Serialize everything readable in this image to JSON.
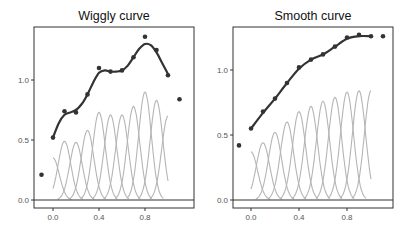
{
  "chart_data": [
    {
      "type": "line",
      "title": "Wiggly curve",
      "xlabel": "",
      "ylabel": "",
      "xlim": [
        -0.13,
        1.13
      ],
      "ylim": [
        -0.06,
        1.45
      ],
      "x_ticks": [
        "0.0",
        "0.4",
        "0.8"
      ],
      "y_ticks": [
        "0.0",
        "0.5",
        "1.0"
      ],
      "grid": false,
      "points": {
        "x": [
          -0.1,
          0.0,
          0.1,
          0.2,
          0.3,
          0.4,
          0.5,
          0.6,
          0.7,
          0.8,
          0.9,
          1.0,
          1.1
        ],
        "y": [
          0.21,
          0.52,
          0.74,
          0.73,
          0.88,
          1.1,
          1.07,
          1.08,
          1.19,
          1.36,
          1.25,
          1.04,
          0.84
        ]
      },
      "fitted_curve": {
        "x": [
          0.0,
          0.05,
          0.1,
          0.15,
          0.2,
          0.25,
          0.3,
          0.35,
          0.4,
          0.45,
          0.5,
          0.55,
          0.6,
          0.65,
          0.7,
          0.75,
          0.8,
          0.85,
          0.9,
          0.95,
          1.0
        ],
        "y": [
          0.52,
          0.64,
          0.71,
          0.73,
          0.75,
          0.8,
          0.88,
          0.98,
          1.06,
          1.08,
          1.07,
          1.07,
          1.08,
          1.12,
          1.19,
          1.26,
          1.3,
          1.29,
          1.23,
          1.14,
          1.05
        ]
      },
      "basis_peaks": {
        "x": [
          0.0,
          0.1,
          0.2,
          0.3,
          0.4,
          0.5,
          0.6,
          0.7,
          0.8,
          0.9,
          1.0
        ],
        "height": [
          0.35,
          0.49,
          0.48,
          0.58,
          0.73,
          0.71,
          0.71,
          0.78,
          0.9,
          0.83,
          0.7
        ]
      }
    },
    {
      "type": "line",
      "title": "Smooth curve",
      "xlabel": "",
      "ylabel": "",
      "xlim": [
        -0.13,
        1.13
      ],
      "ylim": [
        -0.06,
        1.35
      ],
      "x_ticks": [
        "0.0",
        "0.4",
        "0.8"
      ],
      "y_ticks": [
        "0.0",
        "0.5",
        "1.0"
      ],
      "grid": false,
      "points": {
        "x": [
          -0.1,
          0.0,
          0.1,
          0.2,
          0.3,
          0.4,
          0.5,
          0.6,
          0.7,
          0.8,
          0.9,
          1.0,
          1.1
        ],
        "y": [
          0.42,
          0.55,
          0.68,
          0.78,
          0.9,
          1.02,
          1.08,
          1.12,
          1.18,
          1.25,
          1.27,
          1.26,
          1.26
        ]
      },
      "fitted_curve": {
        "x": [
          0.0,
          0.1,
          0.2,
          0.3,
          0.4,
          0.5,
          0.6,
          0.7,
          0.8,
          0.9,
          1.0
        ],
        "y": [
          0.55,
          0.67,
          0.78,
          0.9,
          1.01,
          1.08,
          1.12,
          1.18,
          1.24,
          1.26,
          1.26
        ]
      },
      "basis_peaks": {
        "x": [
          0.0,
          0.1,
          0.2,
          0.3,
          0.4,
          0.5,
          0.6,
          0.7,
          0.8,
          0.9,
          1.0
        ],
        "height": [
          0.37,
          0.44,
          0.52,
          0.6,
          0.68,
          0.72,
          0.76,
          0.79,
          0.83,
          0.84,
          0.84
        ]
      }
    }
  ]
}
